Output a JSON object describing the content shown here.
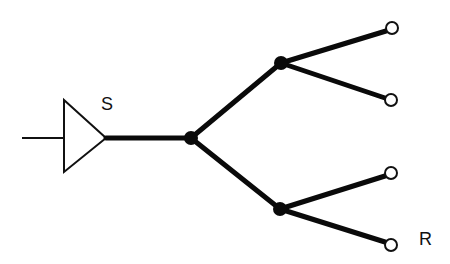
{
  "diagram": {
    "type": "tree-network",
    "colors": {
      "background": "#ffffff",
      "line": "#0a0a0a",
      "terminal_fill": "#ffffff"
    },
    "source": {
      "label": "S",
      "symbol": "buffer-triangle",
      "input_line": {
        "x1": 22,
        "y1": 138,
        "x2": 64,
        "y2": 138
      },
      "triangle": {
        "points": "64,100 64,172 106,138"
      },
      "label_pos": {
        "x": 101,
        "y": 110
      }
    },
    "junctions": [
      {
        "id": "root",
        "x": 191,
        "y": 138,
        "r": 7
      },
      {
        "id": "upper",
        "x": 281,
        "y": 63,
        "r": 7
      },
      {
        "id": "lower",
        "x": 280,
        "y": 209,
        "r": 7
      }
    ],
    "wires": [
      {
        "from": "source",
        "x1": 106,
        "y1": 138,
        "x2": 191,
        "y2": 138
      },
      {
        "from": "root",
        "to": "upper",
        "x1": 191,
        "y1": 138,
        "x2": 281,
        "y2": 63
      },
      {
        "from": "root",
        "to": "lower",
        "x1": 191,
        "y1": 138,
        "x2": 280,
        "y2": 209
      },
      {
        "from": "upper",
        "to": "t1",
        "x1": 281,
        "y1": 63,
        "x2": 386,
        "y2": 31
      },
      {
        "from": "upper",
        "to": "t2",
        "x1": 281,
        "y1": 63,
        "x2": 385,
        "y2": 98
      },
      {
        "from": "lower",
        "to": "t3",
        "x1": 280,
        "y1": 209,
        "x2": 385,
        "y2": 176
      },
      {
        "from": "lower",
        "to": "t4",
        "x1": 280,
        "y1": 209,
        "x2": 385,
        "y2": 242
      }
    ],
    "terminals": [
      {
        "id": "t1",
        "x": 392,
        "y": 28,
        "r": 6
      },
      {
        "id": "t2",
        "x": 391,
        "y": 100,
        "r": 6
      },
      {
        "id": "t3",
        "x": 391,
        "y": 173,
        "r": 6
      },
      {
        "id": "t4",
        "x": 391,
        "y": 245,
        "r": 6
      }
    ],
    "receiver": {
      "label": "R",
      "label_pos": {
        "x": 419,
        "y": 245
      }
    }
  }
}
